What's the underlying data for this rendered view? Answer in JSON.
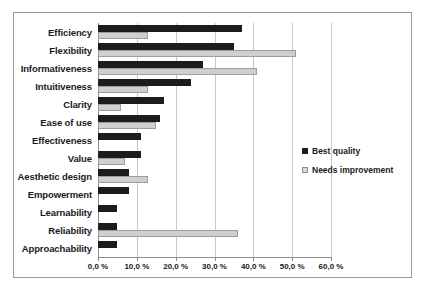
{
  "chart_data": {
    "type": "bar",
    "orientation": "horizontal",
    "title": "",
    "xlabel": "",
    "ylabel": "",
    "xlim": [
      0,
      60
    ],
    "xticks": [
      "0,0 %",
      "10,0 %",
      "20,0 %",
      "30,0 %",
      "40,0 %",
      "50,0 %",
      "60,0 %"
    ],
    "xtick_values": [
      0,
      10,
      20,
      30,
      40,
      50,
      60
    ],
    "grid": true,
    "legend_position": "right-middle",
    "categories": [
      "Efficiency",
      "Flexibility",
      "Informativeness",
      "Intuitiveness",
      "Clarity",
      "Ease of use",
      "Effectiveness",
      "Value",
      "Aesthetic design",
      "Empowerment",
      "Learnability",
      "Reliability",
      "Approachability"
    ],
    "series": [
      {
        "name": "Best quality",
        "color": "#1c1c1c",
        "values": [
          37,
          35,
          27,
          24,
          17,
          16,
          11,
          11,
          8,
          8,
          5,
          5,
          5
        ]
      },
      {
        "name": "Needs improvement",
        "color": "#cfcfcf",
        "values": [
          13,
          51,
          41,
          13,
          6,
          15,
          0,
          7,
          13,
          0,
          0,
          36,
          0
        ]
      }
    ]
  },
  "legend": {
    "items": [
      {
        "label": "Best quality",
        "swatch": "best"
      },
      {
        "label": "Needs improvement",
        "swatch": "needs"
      }
    ]
  }
}
